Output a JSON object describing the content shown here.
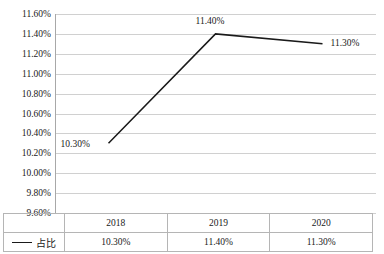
{
  "chart_data": {
    "type": "line",
    "title": "",
    "xlabel": "",
    "ylabel": "",
    "categories": [
      "2018",
      "2019",
      "2020"
    ],
    "series": [
      {
        "name": "占比",
        "values": [
          10.3,
          11.4,
          11.3
        ],
        "value_labels": [
          "10.30%",
          "11.40%",
          "11.30%"
        ],
        "color": "#1a1a1a"
      }
    ],
    "ylim": [
      9.6,
      11.6
    ],
    "ytick_step": 0.2,
    "ytick_labels": [
      "11.60%",
      "11.40%",
      "11.20%",
      "11.00%",
      "10.80%",
      "10.60%",
      "10.40%",
      "10.20%",
      "10.00%",
      "9.80%",
      "9.60%"
    ],
    "ytick_values": [
      11.6,
      11.4,
      11.2,
      11.0,
      10.8,
      10.6,
      10.4,
      10.2,
      10.0,
      9.8,
      9.6
    ],
    "grid": true,
    "legend_position": "data-table-left",
    "data_labels_shown": true
  },
  "data_table": {
    "header_row": [
      "",
      "2018",
      "2019",
      "2020"
    ],
    "series_row": {
      "legend_label": "占比",
      "legend_marker": "line-marker-icon",
      "cells": [
        "10.30%",
        "11.40%",
        "11.30%"
      ]
    }
  },
  "colors": {
    "series_line": "#1a1a1a",
    "gridline": "#d0d0d0",
    "axis": "#a8a8a8",
    "table_border": "#b5b5b5",
    "text": "#1a1a1a",
    "background": "#ffffff"
  }
}
